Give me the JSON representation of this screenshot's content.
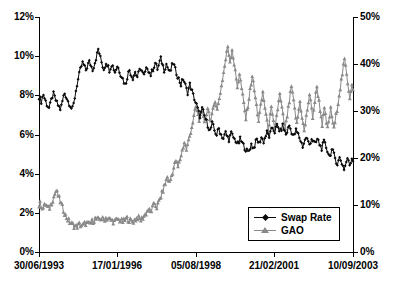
{
  "chart_data": {
    "type": "line",
    "title": "",
    "xlabel": "",
    "ylabel": "",
    "grid": false,
    "legend_position": "bottom-right",
    "x_axis": {
      "tick_labels": [
        "30/06/1993",
        "17/01/1996",
        "05/08/1998",
        "21/02/2001",
        "10/09/2003"
      ],
      "tick_positions_frac": [
        0.0,
        0.2484,
        0.5,
        0.7484,
        1.0
      ]
    },
    "y_axis_left": {
      "label": "",
      "ticks": [
        "0%",
        "2%",
        "4%",
        "6%",
        "8%",
        "10%",
        "12%"
      ],
      "values": [
        0,
        2,
        4,
        6,
        8,
        10,
        12
      ],
      "ylim": [
        0,
        12
      ],
      "unit": "%"
    },
    "y_axis_right": {
      "label": "",
      "ticks": [
        "0%",
        "10%",
        "20%",
        "30%",
        "40%",
        "50%"
      ],
      "values": [
        0,
        10,
        20,
        30,
        40,
        50
      ],
      "ylim": [
        0,
        50
      ],
      "unit": "%"
    },
    "series": [
      {
        "name": "Swap Rate",
        "axis": "left",
        "color": "#0b0b0b",
        "marker": "diamond",
        "values": [
          7.95,
          7.8,
          7.7,
          7.9,
          8.05,
          7.85,
          7.7,
          7.55,
          7.45,
          7.35,
          7.5,
          7.75,
          7.95,
          8.05,
          7.9,
          7.75,
          7.6,
          7.5,
          7.4,
          7.3,
          7.45,
          7.7,
          7.95,
          8.1,
          8.0,
          7.85,
          7.7,
          7.6,
          7.5,
          7.35,
          7.3,
          7.55,
          7.9,
          8.25,
          8.55,
          8.8,
          9.05,
          9.3,
          9.5,
          9.65,
          9.55,
          9.4,
          9.3,
          9.45,
          9.6,
          9.7,
          9.6,
          9.45,
          9.35,
          9.5,
          9.7,
          9.9,
          10.1,
          10.35,
          10.15,
          9.9,
          9.7,
          9.5,
          9.35,
          9.5,
          9.7,
          9.6,
          9.45,
          9.3,
          9.45,
          9.6,
          9.5,
          9.35,
          9.2,
          9.35,
          9.5,
          9.4,
          9.25,
          9.1,
          9.0,
          8.85,
          8.7,
          8.55,
          8.7,
          8.95,
          9.15,
          9.3,
          9.15,
          9.0,
          8.9,
          9.05,
          9.2,
          9.05,
          8.95,
          9.1,
          9.25,
          9.4,
          9.25,
          9.1,
          9.0,
          9.15,
          9.3,
          9.45,
          9.3,
          9.15,
          9.05,
          9.2,
          9.35,
          9.5,
          9.65,
          9.5,
          9.35,
          9.5,
          9.7,
          9.85,
          9.7,
          9.5,
          9.3,
          9.45,
          9.6,
          9.45,
          9.3,
          9.15,
          9.3,
          9.5,
          9.65,
          9.5,
          9.3,
          9.15,
          9.0,
          8.85,
          8.7,
          8.55,
          8.7,
          8.85,
          8.7,
          8.5,
          8.3,
          8.15,
          8.35,
          8.55,
          8.4,
          8.2,
          8.0,
          7.85,
          7.65,
          7.5,
          7.3,
          7.1,
          6.95,
          7.1,
          7.3,
          7.15,
          6.95,
          6.8,
          6.65,
          6.5,
          6.35,
          6.2,
          6.35,
          6.55,
          6.4,
          6.2,
          6.1,
          6.0,
          6.15,
          6.3,
          6.15,
          6.0,
          5.9,
          5.8,
          5.95,
          6.1,
          5.95,
          5.85,
          5.75,
          5.9,
          6.05,
          5.95,
          5.85,
          5.75,
          5.7,
          5.6,
          5.5,
          5.6,
          5.75,
          5.65,
          5.55,
          5.45,
          5.35,
          5.25,
          5.15,
          5.1,
          5.2,
          5.35,
          5.5,
          5.4,
          5.3,
          5.45,
          5.6,
          5.75,
          5.65,
          5.55,
          5.7,
          5.85,
          5.75,
          5.65,
          5.8,
          5.95,
          6.1,
          6.0,
          5.9,
          6.05,
          6.2,
          6.35,
          6.25,
          6.15,
          6.3,
          6.45,
          6.35,
          6.25,
          6.15,
          6.3,
          6.45,
          6.3,
          6.15,
          6.0,
          6.15,
          6.3,
          6.45,
          6.3,
          6.15,
          6.0,
          5.9,
          6.05,
          6.2,
          6.1,
          6.0,
          5.85,
          5.7,
          5.55,
          5.4,
          5.55,
          5.7,
          5.85,
          5.75,
          5.6,
          5.5,
          5.65,
          5.8,
          5.7,
          5.6,
          5.5,
          5.6,
          5.75,
          5.65,
          5.5,
          5.4,
          5.3,
          5.45,
          5.6,
          5.5,
          5.35,
          5.2,
          5.05,
          4.9,
          5.05,
          5.2,
          5.1,
          4.95,
          4.8,
          4.65,
          4.5,
          4.65,
          4.8,
          4.7,
          4.55,
          4.4,
          4.25,
          4.4,
          4.6,
          4.8,
          4.6,
          4.45,
          4.6,
          4.8,
          4.75
        ]
      },
      {
        "name": "GAO",
        "axis": "right",
        "color": "#8a8a8a",
        "marker": "triangle",
        "values": [
          9.9,
          10.3,
          10.0,
          9.6,
          9.4,
          9.8,
          10.2,
          9.9,
          9.5,
          9.2,
          9.5,
          10.0,
          10.6,
          11.2,
          11.8,
          12.4,
          13.0,
          12.6,
          12.0,
          11.4,
          10.8,
          10.2,
          9.6,
          9.0,
          8.4,
          7.8,
          7.4,
          7.0,
          6.7,
          6.4,
          6.2,
          6.0,
          5.8,
          5.6,
          5.5,
          5.4,
          5.5,
          5.7,
          5.9,
          5.8,
          5.7,
          5.6,
          5.8,
          6.0,
          6.2,
          6.1,
          6.0,
          5.9,
          6.1,
          6.3,
          6.5,
          6.7,
          6.9,
          7.1,
          7.0,
          6.9,
          6.8,
          7.0,
          7.2,
          7.1,
          7.0,
          6.9,
          7.1,
          7.3,
          7.2,
          7.1,
          7.0,
          6.9,
          6.8,
          6.7,
          6.6,
          6.5,
          6.6,
          6.8,
          7.0,
          6.9,
          6.8,
          6.7,
          6.6,
          6.5,
          6.6,
          6.8,
          7.0,
          7.2,
          7.0,
          6.8,
          6.7,
          6.6,
          6.5,
          6.6,
          6.8,
          7.0,
          7.2,
          7.4,
          7.2,
          7.0,
          6.9,
          7.1,
          7.4,
          7.7,
          8.0,
          8.3,
          8.7,
          9.1,
          8.8,
          8.5,
          8.9,
          9.4,
          9.9,
          10.4,
          10.0,
          9.6,
          10.1,
          10.7,
          11.3,
          11.9,
          12.5,
          13.2,
          13.9,
          14.6,
          15.3,
          16.0,
          15.4,
          14.8,
          15.5,
          16.3,
          17.1,
          17.9,
          18.7,
          19.5,
          18.8,
          18.1,
          18.9,
          19.8,
          20.7,
          21.6,
          22.5,
          23.4,
          22.6,
          21.8,
          22.7,
          23.7,
          24.7,
          25.7,
          26.7,
          27.7,
          28.8,
          29.9,
          31.0,
          30.0,
          29.0,
          28.0,
          29.1,
          30.3,
          29.3,
          28.3,
          27.3,
          28.4,
          29.6,
          30.8,
          29.8,
          28.8,
          27.8,
          28.9,
          30.1,
          31.3,
          32.5,
          31.4,
          30.3,
          31.5,
          32.8,
          34.1,
          35.4,
          36.8,
          38.2,
          39.6,
          41.0,
          42.4,
          43.8,
          42.2,
          40.6,
          41.9,
          43.2,
          41.6,
          40.0,
          38.4,
          36.8,
          35.2,
          36.6,
          38.0,
          36.4,
          34.8,
          33.2,
          31.6,
          30.0,
          28.4,
          29.8,
          31.3,
          32.8,
          34.4,
          36.0,
          37.6,
          36.0,
          34.4,
          32.8,
          31.2,
          29.6,
          28.0,
          29.5,
          31.0,
          32.5,
          34.0,
          32.4,
          30.8,
          29.2,
          27.6,
          26.0,
          27.5,
          29.0,
          30.5,
          29.0,
          27.5,
          26.0,
          27.5,
          29.0,
          30.5,
          32.0,
          33.5,
          32.0,
          30.5,
          29.0,
          27.5,
          26.0,
          27.5,
          29.0,
          30.5,
          32.0,
          33.6,
          35.2,
          33.6,
          32.0,
          30.4,
          28.8,
          27.2,
          28.8,
          30.4,
          32.0,
          30.4,
          28.8,
          27.2,
          25.6,
          27.2,
          28.8,
          30.4,
          32.0,
          33.6,
          32.0,
          30.4,
          28.8,
          30.4,
          32.0,
          33.6,
          35.2,
          33.6,
          32.0,
          30.4,
          28.8,
          27.2,
          28.8,
          30.4,
          29.0,
          27.6,
          26.2,
          27.6,
          29.0,
          30.4,
          29.0,
          27.6,
          26.2,
          27.6,
          29.0,
          30.5,
          32.0,
          33.5,
          35.0,
          36.5,
          38.0,
          39.5,
          41.0,
          39.4,
          37.8,
          36.2,
          34.6,
          33.0,
          34.5,
          36.0,
          34.4
        ]
      }
    ]
  },
  "legend": {
    "items": [
      {
        "label": "Swap Rate",
        "marker": "diamond",
        "color": "#0b0b0b"
      },
      {
        "label": "GAO",
        "marker": "triangle",
        "color": "#8a8a8a"
      }
    ]
  },
  "colors": {
    "swap_rate": "#0b0b0b",
    "gao": "#8a8a8a",
    "axis": "#000000",
    "background": "#ffffff"
  }
}
